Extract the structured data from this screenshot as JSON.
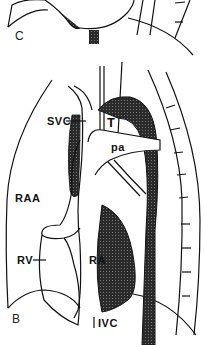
{
  "figure": {
    "panels": [
      {
        "id": "C",
        "label": "C"
      },
      {
        "id": "B",
        "label": "B"
      }
    ],
    "labels": {
      "svc": "SVC",
      "t": "T",
      "pa": "pa",
      "raa": "RAA",
      "rv": "RV",
      "ra": "RA",
      "ivc": "IVC"
    },
    "colors": {
      "ink": "#111111",
      "shade": "#333333",
      "background": "#ffffff"
    }
  }
}
